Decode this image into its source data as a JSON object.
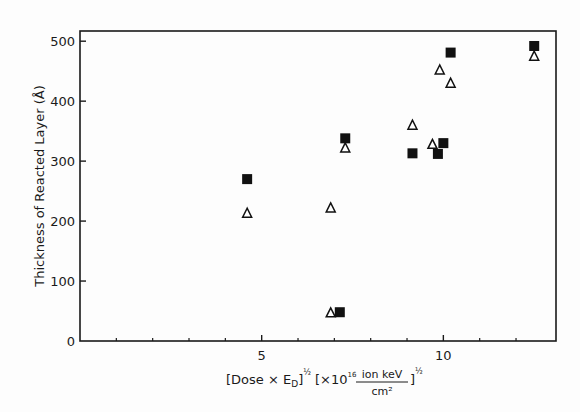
{
  "chart_data": {
    "type": "scatter",
    "title": "",
    "xlabel": "[Dose × E_D]^½ [×10^16 ion keV / cm²]^½",
    "xlabel_parts": {
      "main": "[Dose × E",
      "sub": "D",
      "close": "]",
      "exp1": "½",
      "bracket_open": "[×10",
      "exp_power": "16",
      "numerator": "ion keV",
      "denominator": "cm²",
      "bracket_close": "]",
      "exp2": "½"
    },
    "ylabel": "Thickness of Reacted Layer (Å)",
    "xlim": [
      0,
      13.1
    ],
    "ylim": [
      0,
      517
    ],
    "x_major_ticks": [
      5,
      10
    ],
    "x_minor_ticks": [
      1,
      2,
      3,
      4,
      6,
      7,
      8,
      9,
      11,
      12
    ],
    "y_ticks": [
      0,
      100,
      200,
      300,
      400,
      500
    ],
    "grid": false,
    "legend": null,
    "series": [
      {
        "name": "filled squares",
        "marker": "square-filled",
        "points": [
          {
            "x": 4.6,
            "y": 270
          },
          {
            "x": 7.15,
            "y": 48
          },
          {
            "x": 7.3,
            "y": 338
          },
          {
            "x": 9.15,
            "y": 313
          },
          {
            "x": 9.85,
            "y": 312
          },
          {
            "x": 10.0,
            "y": 330
          },
          {
            "x": 10.2,
            "y": 481
          },
          {
            "x": 12.5,
            "y": 492
          }
        ]
      },
      {
        "name": "open triangles",
        "marker": "triangle-open",
        "points": [
          {
            "x": 4.6,
            "y": 213
          },
          {
            "x": 6.9,
            "y": 222
          },
          {
            "x": 6.9,
            "y": 47
          },
          {
            "x": 7.3,
            "y": 322
          },
          {
            "x": 9.15,
            "y": 360
          },
          {
            "x": 9.7,
            "y": 328
          },
          {
            "x": 9.9,
            "y": 452
          },
          {
            "x": 10.2,
            "y": 430
          },
          {
            "x": 12.5,
            "y": 475
          }
        ]
      }
    ]
  }
}
